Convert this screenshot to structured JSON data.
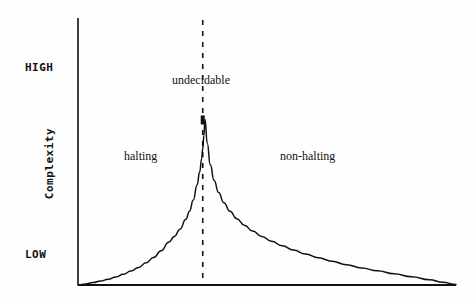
{
  "chart_data": {
    "type": "line",
    "title": "",
    "subtitle": "",
    "xlabel": "",
    "ylabel": "Complexity",
    "y_tick_labels": [
      "HIGH",
      "LOW"
    ],
    "x_tick_labels": [],
    "grid": false,
    "legend": null,
    "axis_color": "#111111",
    "curve_color": "#111111",
    "marker_color": "#111111",
    "background": "#fefefe",
    "annotations": [
      {
        "text": "halting",
        "x": 0.16,
        "y": 0.52
      },
      {
        "text": "undecidable",
        "x": 0.33,
        "y": 0.8
      },
      {
        "text": "non-halting",
        "x": 0.58,
        "y": 0.52
      }
    ],
    "vertical_marker": {
      "label": "undecidable",
      "x": 0.33,
      "style": "dashed"
    },
    "peak": {
      "x": 0.33,
      "y": 0.62
    },
    "xlim": [
      0,
      1
    ],
    "ylim": [
      0,
      1
    ],
    "series": [
      {
        "name": "complexity",
        "x": [
          0.0,
          0.02,
          0.04,
          0.06,
          0.08,
          0.1,
          0.12,
          0.14,
          0.16,
          0.18,
          0.2,
          0.22,
          0.24,
          0.255,
          0.27,
          0.285,
          0.295,
          0.305,
          0.315,
          0.322,
          0.327,
          0.33,
          0.333,
          0.336,
          0.342,
          0.35,
          0.36,
          0.372,
          0.386,
          0.402,
          0.42,
          0.44,
          0.462,
          0.486,
          0.512,
          0.54,
          0.57,
          0.602,
          0.636,
          0.672,
          0.71,
          0.75,
          0.792,
          0.836,
          0.882,
          0.93,
          0.965,
          1.0
        ],
        "y": [
          0.0,
          0.004,
          0.009,
          0.015,
          0.022,
          0.03,
          0.04,
          0.052,
          0.066,
          0.083,
          0.103,
          0.128,
          0.16,
          0.182,
          0.209,
          0.245,
          0.276,
          0.318,
          0.375,
          0.424,
          0.472,
          0.51,
          0.56,
          0.62,
          0.53,
          0.45,
          0.392,
          0.346,
          0.308,
          0.276,
          0.248,
          0.224,
          0.202,
          0.182,
          0.164,
          0.147,
          0.131,
          0.116,
          0.102,
          0.089,
          0.076,
          0.064,
          0.053,
          0.042,
          0.031,
          0.02,
          0.01,
          0.002
        ]
      }
    ]
  },
  "labels": {
    "high": "HIGH",
    "low": "LOW",
    "complexity": "Complexity",
    "halting": "halting",
    "undecidable": "undecidable",
    "non_halting": "non-halting"
  }
}
